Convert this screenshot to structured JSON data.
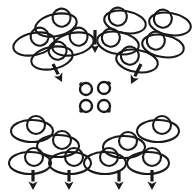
{
  "figure": {
    "title": "Four clusters of ellipse-and-circle motifs with directional arrows",
    "canvas_width": 192,
    "canvas_height": 195,
    "background_color": "#ffffff",
    "stroke_color": "#1a1a1a",
    "motif_description": "outlined ellipse with a smaller circle overlapping its upper edge",
    "clusters": [
      {
        "name": "top-left-cluster",
        "label": "Top-left group",
        "count": 4,
        "core_side": "upper-right",
        "motifs": [
          {
            "cx": 34,
            "cy": 44,
            "rx": 21,
            "ry": 11,
            "rot": -12,
            "core_cx": 41,
            "core_cy": 38,
            "core_r": 9
          },
          {
            "cx": 56,
            "cy": 25,
            "rx": 21,
            "ry": 11,
            "rot": -12,
            "core_cx": 63,
            "core_cy": 19,
            "core_r": 9
          },
          {
            "cx": 73,
            "cy": 44,
            "rx": 21,
            "ry": 11,
            "rot": -12,
            "core_cx": 80,
            "core_cy": 38,
            "core_r": 9
          },
          {
            "cx": 52,
            "cy": 58,
            "rx": 21,
            "ry": 11,
            "rot": -12,
            "core_cx": 59,
            "core_cy": 52,
            "core_r": 9
          }
        ]
      },
      {
        "name": "top-right-cluster",
        "label": "Top-right group",
        "count": 5,
        "core_side": "upper-left",
        "motifs": [
          {
            "cx": 125,
            "cy": 22,
            "rx": 21,
            "ry": 11,
            "rot": 10,
            "core_cx": 117,
            "core_cy": 18,
            "core_r": 9
          },
          {
            "cx": 170,
            "cy": 24,
            "rx": 21,
            "ry": 11,
            "rot": 10,
            "core_cx": 162,
            "core_cy": 20,
            "core_r": 9
          },
          {
            "cx": 118,
            "cy": 43,
            "rx": 21,
            "ry": 11,
            "rot": 10,
            "core_cx": 110,
            "core_cy": 39,
            "core_r": 9
          },
          {
            "cx": 163,
            "cy": 46,
            "rx": 21,
            "ry": 11,
            "rot": 10,
            "core_cx": 155,
            "core_cy": 42,
            "core_r": 9
          },
          {
            "cx": 137,
            "cy": 61,
            "rx": 21,
            "ry": 11,
            "rot": 10,
            "core_cx": 129,
            "core_cy": 57,
            "core_r": 9
          }
        ]
      },
      {
        "name": "bottom-left-cluster",
        "label": "Bottom-left group",
        "count": 4,
        "core_side": "top-center",
        "motifs": [
          {
            "cx": 32,
            "cy": 131,
            "rx": 21,
            "ry": 11,
            "rot": 0,
            "core_cx": 36,
            "core_cy": 125,
            "core_r": 9
          },
          {
            "cx": 58,
            "cy": 146,
            "rx": 21,
            "ry": 11,
            "rot": 0,
            "core_cx": 62,
            "core_cy": 140,
            "core_r": 9
          },
          {
            "cx": 30,
            "cy": 163,
            "rx": 21,
            "ry": 11,
            "rot": 0,
            "core_cx": 34,
            "core_cy": 157,
            "core_r": 9
          },
          {
            "cx": 70,
            "cy": 163,
            "rx": 21,
            "ry": 11,
            "rot": 0,
            "core_cx": 74,
            "core_cy": 157,
            "core_r": 9
          }
        ]
      },
      {
        "name": "bottom-right-cluster",
        "label": "Bottom-right group",
        "count": 4,
        "core_side": "top-center",
        "motifs": [
          {
            "cx": 158,
            "cy": 131,
            "rx": 21,
            "ry": 11,
            "rot": 0,
            "core_cx": 162,
            "core_cy": 125,
            "core_r": 9
          },
          {
            "cx": 124,
            "cy": 147,
            "rx": 21,
            "ry": 11,
            "rot": 0,
            "core_cx": 128,
            "core_cy": 141,
            "core_r": 9
          },
          {
            "cx": 105,
            "cy": 163,
            "rx": 21,
            "ry": 11,
            "rot": 0,
            "core_cx": 109,
            "core_cy": 157,
            "core_r": 9
          },
          {
            "cx": 148,
            "cy": 163,
            "rx": 21,
            "ry": 11,
            "rot": 0,
            "core_cx": 152,
            "core_cy": 157,
            "core_r": 9
          }
        ]
      }
    ],
    "center_group": {
      "name": "center-mini-group",
      "label": "Center group of small rings",
      "count": 4,
      "rings": [
        {
          "cx": 86,
          "cy": 89,
          "r": 6,
          "nub_angle": 225
        },
        {
          "cx": 104,
          "cy": 88,
          "r": 6,
          "nub_angle": 315
        },
        {
          "cx": 86,
          "cy": 106,
          "r": 6,
          "nub_angle": 135
        },
        {
          "cx": 104,
          "cy": 106,
          "r": 6,
          "nub_angle": 45
        }
      ]
    },
    "arrows": [
      {
        "name": "arrow-top-center",
        "label": "Down arrow, top center",
        "x1": 95,
        "y1": 30,
        "x2": 95,
        "y2": 53,
        "direction": "down"
      },
      {
        "name": "arrow-left-diagonal",
        "label": "Down-right arrow, left middle",
        "x1": 53,
        "y1": 64,
        "x2": 62,
        "y2": 82,
        "direction": "down-right"
      },
      {
        "name": "arrow-right-diagonal",
        "label": "Down-left arrow, right middle",
        "x1": 141,
        "y1": 64,
        "x2": 131,
        "y2": 84,
        "direction": "down-left"
      },
      {
        "name": "arrow-bottom-1",
        "label": "Down arrow, bottom first",
        "x1": 33,
        "y1": 170,
        "x2": 33,
        "y2": 190,
        "direction": "down"
      },
      {
        "name": "arrow-bottom-2",
        "label": "Down arrow, bottom second",
        "x1": 69,
        "y1": 170,
        "x2": 69,
        "y2": 190,
        "direction": "down"
      },
      {
        "name": "arrow-bottom-3",
        "label": "Down arrow, bottom third",
        "x1": 119,
        "y1": 170,
        "x2": 119,
        "y2": 190,
        "direction": "down"
      },
      {
        "name": "arrow-bottom-4",
        "label": "Down arrow, bottom fourth",
        "x1": 152,
        "y1": 170,
        "x2": 152,
        "y2": 190,
        "direction": "down"
      }
    ]
  }
}
